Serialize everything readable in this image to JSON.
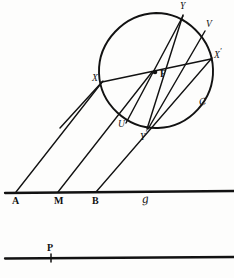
{
  "figure": {
    "ink_color": "#121212",
    "background_color": "#fdfdfc"
  },
  "circle": {
    "label": "ᶜᶠ",
    "label_plain": "C",
    "center_point_label": "F",
    "cx": 156,
    "cy": 70,
    "r": 57
  },
  "points": {
    "Y": "Y",
    "V": "V",
    "X_prime": "X",
    "X_prime_mark": "′",
    "F": "F",
    "X": "X",
    "U": "U",
    "Y_prime": "Y",
    "Y_prime_mark": "′",
    "A": "A",
    "M": "M",
    "B": "B",
    "P": "P"
  },
  "lines": {
    "baseline_label": "ᵍ",
    "baseline_label_plain": "g",
    "lower_line_point": "P"
  },
  "geometry": {
    "circle_points": [
      {
        "name": "Y",
        "x": 183,
        "y": 14
      },
      {
        "name": "V",
        "x": 205,
        "y": 30
      },
      {
        "name": "X_prime",
        "x": 211,
        "y": 58
      },
      {
        "name": "X",
        "x": 103,
        "y": 81
      },
      {
        "name": "U",
        "x": 126,
        "y": 122
      },
      {
        "name": "Y_prime",
        "x": 147,
        "y": 130
      },
      {
        "name": "F",
        "x": 155,
        "y": 72
      }
    ],
    "baseline_points": [
      {
        "name": "A",
        "x": 16,
        "y": 193
      },
      {
        "name": "M",
        "x": 58,
        "y": 193
      },
      {
        "name": "B",
        "x": 96,
        "y": 193
      }
    ],
    "lower_line_points": [
      {
        "name": "P",
        "x": 51,
        "y": 258
      }
    ],
    "baseline_y": 193,
    "lower_line_y": 258
  }
}
